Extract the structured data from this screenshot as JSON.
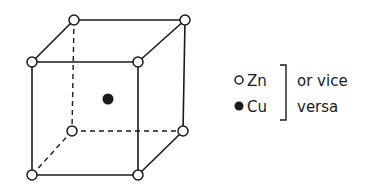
{
  "diagram": {
    "type": "crystal-unit-cell",
    "structure": "body-centered cubic",
    "corner_atoms": [
      {
        "id": "back-top-left",
        "x": 74,
        "y": 20
      },
      {
        "id": "back-top-right",
        "x": 185,
        "y": 20
      },
      {
        "id": "front-top-left",
        "x": 32,
        "y": 62
      },
      {
        "id": "front-top-right",
        "x": 138,
        "y": 62
      },
      {
        "id": "back-bottom-left",
        "x": 72,
        "y": 131
      },
      {
        "id": "back-bottom-right",
        "x": 183,
        "y": 131
      },
      {
        "id": "front-bottom-left",
        "x": 32,
        "y": 175
      },
      {
        "id": "front-bottom-right",
        "x": 138,
        "y": 175
      }
    ],
    "center_atom": {
      "x": 108,
      "y": 99
    },
    "colors": {
      "line": "#1a1a1a",
      "background": "#ffffff"
    }
  },
  "legend": {
    "items": [
      {
        "symbol": "open-circle",
        "label": "Zn"
      },
      {
        "symbol": "filled-circle",
        "label": "Cu"
      }
    ],
    "note_line1": "or vice",
    "note_line2": "versa"
  }
}
